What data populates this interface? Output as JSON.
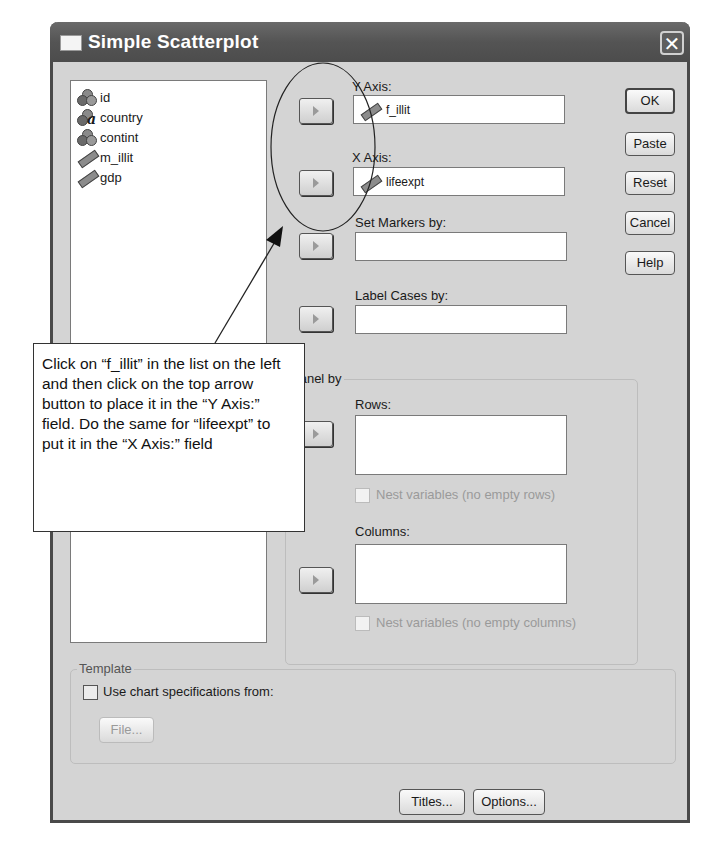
{
  "dialog": {
    "title": "Simple Scatterplot",
    "close_label": "✕"
  },
  "variables": [
    {
      "name": "id",
      "icon": "nominal-icon"
    },
    {
      "name": "country",
      "icon": "string-nominal-icon",
      "glyph": "a"
    },
    {
      "name": "contint",
      "icon": "nominal-icon"
    },
    {
      "name": "m_illit",
      "icon": "scale-icon"
    },
    {
      "name": "gdp",
      "icon": "scale-icon"
    }
  ],
  "targets": {
    "y_axis": {
      "label": "Y Axis:",
      "value": "f_illit"
    },
    "x_axis": {
      "label": "X Axis:",
      "value": "lifeexpt"
    },
    "set_markers": {
      "label": "Set Markers by:",
      "value": ""
    },
    "label_cases": {
      "label": "Label Cases by:",
      "value": ""
    }
  },
  "panel_by": {
    "legend": "Panel by",
    "rows": {
      "label": "Rows:",
      "value": "",
      "nest_label": "Nest variables (no empty rows)",
      "nest_checked": false
    },
    "columns": {
      "label": "Columns:",
      "value": "",
      "nest_label": "Nest variables (no empty columns)",
      "nest_checked": false
    }
  },
  "template": {
    "legend": "Template",
    "use_chart_label": "Use chart specifications from:",
    "use_chart_checked": false,
    "file_label": "File..."
  },
  "side_buttons": {
    "ok": "OK",
    "paste": "Paste",
    "reset": "Reset",
    "cancel": "Cancel",
    "help": "Help"
  },
  "bottom_buttons": {
    "titles": "Titles...",
    "options": "Options..."
  },
  "annotation": {
    "text": "Click on “f_illit” in the list on the left and then click on the top arrow button to place it in the “Y Axis:” field. Do the same for “lifeexpt” to put it in the “X Axis:” field"
  }
}
